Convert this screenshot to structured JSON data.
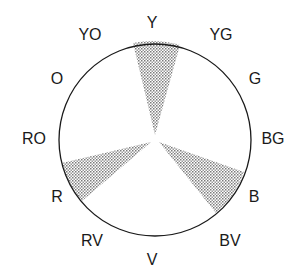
{
  "diagram": {
    "type": "color-wheel",
    "scheme": "triad",
    "center": [
      155,
      140
    ],
    "radius": 96,
    "labels": [
      {
        "text": "Y",
        "x": 152,
        "y": 28
      },
      {
        "text": "YG",
        "x": 221,
        "y": 40
      },
      {
        "text": "G",
        "x": 255,
        "y": 84
      },
      {
        "text": "BG",
        "x": 273,
        "y": 144
      },
      {
        "text": "B",
        "x": 254,
        "y": 202
      },
      {
        "text": "BV",
        "x": 230,
        "y": 246
      },
      {
        "text": "V",
        "x": 152,
        "y": 265
      },
      {
        "text": "RV",
        "x": 92,
        "y": 246
      },
      {
        "text": "R",
        "x": 57,
        "y": 202
      },
      {
        "text": "RO",
        "x": 34,
        "y": 144
      },
      {
        "text": "O",
        "x": 57,
        "y": 84
      },
      {
        "text": "YO",
        "x": 90,
        "y": 40
      }
    ],
    "highlighted_segments": [
      "Y",
      "B",
      "R"
    ],
    "colors": {
      "outline": "#1a1a1a",
      "shade": "#8a8a8a",
      "background": "#ffffff"
    }
  }
}
